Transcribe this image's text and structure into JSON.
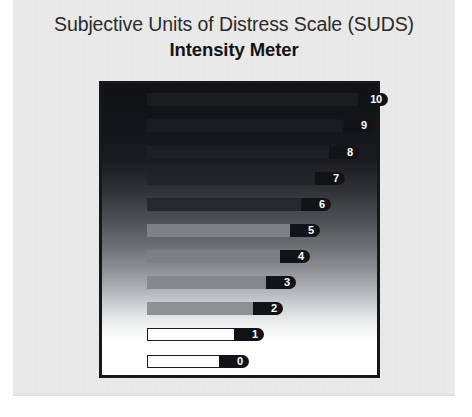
{
  "document": {
    "kind": "scanned-worksheet-figure",
    "page_background": "#ebebeb",
    "outside_background": "#ffffff"
  },
  "header": {
    "title": "Subjective Units of Distress Scale (SUDS)",
    "subtitle": "Intensity Meter"
  },
  "panel": {
    "name": "intensity-gradient-panel",
    "border_color": "#17171a",
    "gradient_top_color": "#111214",
    "gradient_bottom_color": "#ffffff"
  },
  "chart_data": {
    "type": "bar",
    "orientation": "horizontal",
    "title": "Subjective Units of Distress Scale (SUDS) Intensity Meter",
    "subtitle": "Intensity Meter",
    "xlabel": "",
    "ylabel": "",
    "grid": false,
    "legend": false,
    "categories": [
      "10",
      "9",
      "8",
      "7",
      "6",
      "5",
      "4",
      "3",
      "2",
      "1",
      "0"
    ],
    "values": [
      10,
      9,
      8,
      7,
      6,
      5,
      4,
      3,
      2,
      1,
      0
    ],
    "xlim": [
      0,
      10
    ],
    "bar_colors": [
      "#1b1c1f",
      "#1b1c1f",
      "#1e1f23",
      "#222328",
      "#26282d",
      "#7e8085",
      "#7d7f84",
      "#85878c",
      "#8e9095",
      "#ffffff",
      "#ffffff"
    ],
    "label_cap_color": "#121316",
    "label_text_color": "#ffffff",
    "bars": [
      {
        "label": "10",
        "value": 10,
        "top": 93,
        "left": 147,
        "width": 241,
        "fill": "#1b1c1f",
        "outlined": false
      },
      {
        "label": "9",
        "value": 9,
        "top": 119,
        "left": 147,
        "width": 226,
        "fill": "#1b1c1f",
        "outlined": false
      },
      {
        "label": "8",
        "value": 8,
        "top": 146,
        "left": 147,
        "width": 212,
        "fill": "#1e1f23",
        "outlined": false
      },
      {
        "label": "7",
        "value": 7,
        "top": 172,
        "left": 147,
        "width": 198,
        "fill": "#222328",
        "outlined": false
      },
      {
        "label": "6",
        "value": 6,
        "top": 198,
        "left": 147,
        "width": 184,
        "fill": "#26282d",
        "outlined": false
      },
      {
        "label": "5",
        "value": 5,
        "top": 224,
        "left": 147,
        "width": 173,
        "fill": "#7e8085",
        "outlined": false
      },
      {
        "label": "4",
        "value": 4,
        "top": 250,
        "left": 147,
        "width": 163,
        "fill": "#7d7f84",
        "outlined": false
      },
      {
        "label": "3",
        "value": 3,
        "top": 276,
        "left": 147,
        "width": 149,
        "fill": "#85878c",
        "outlined": false
      },
      {
        "label": "2",
        "value": 2,
        "top": 302,
        "left": 147,
        "width": 136,
        "fill": "#8e9095",
        "outlined": false
      },
      {
        "label": "1",
        "value": 1,
        "top": 328,
        "left": 147,
        "width": 117,
        "fill": "#ffffff",
        "outlined": true
      },
      {
        "label": "0",
        "value": 0,
        "top": 355,
        "left": 147,
        "width": 102,
        "fill": "#ffffff",
        "outlined": true
      }
    ]
  }
}
